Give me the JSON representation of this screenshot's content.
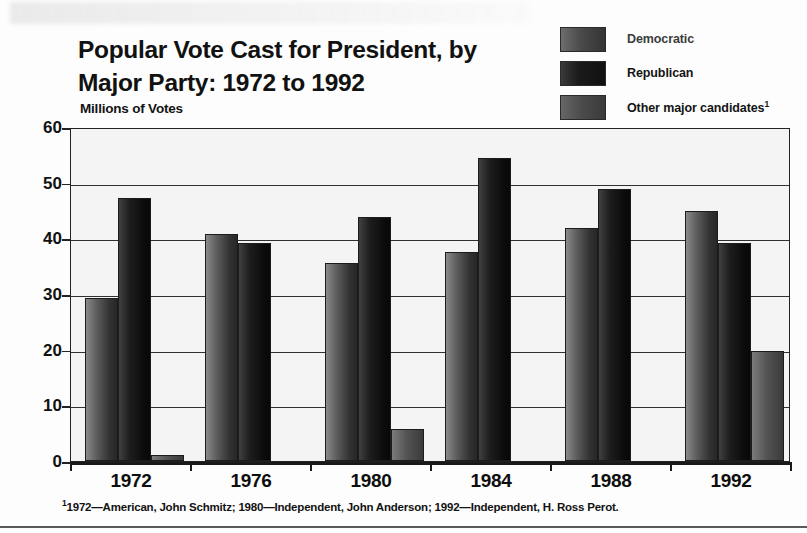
{
  "title": {
    "line1": "Popular Vote Cast for President, by",
    "line2": "Major Party: 1972 to 1992"
  },
  "axis_caption": "Millions of Votes",
  "legend": {
    "items": [
      {
        "label": "Democratic",
        "swatch": "dem-swatch"
      },
      {
        "label": "Republican",
        "swatch": "rep-swatch"
      },
      {
        "label": "Other major candidates",
        "superscript": "1",
        "swatch": "other-swatch"
      }
    ]
  },
  "footnote": {
    "marker": "1",
    "text": "1972—American, John Schmitz; 1980—Independent, John Anderson; 1992—Independent, H. Ross Perot."
  },
  "chart_data": {
    "type": "bar",
    "title": "Popular Vote Cast for President, by Major Party: 1972 to 1992",
    "xlabel": "",
    "ylabel": "Millions of Votes",
    "ylim": [
      0,
      60
    ],
    "yticks": [
      0,
      10,
      20,
      30,
      40,
      50,
      60
    ],
    "ytick_labels": [
      "0",
      "10",
      "20",
      "30",
      "40",
      "50",
      "60"
    ],
    "grid": true,
    "legend_position": "top-right",
    "categories": [
      "1972",
      "1976",
      "1980",
      "1984",
      "1988",
      "1992"
    ],
    "series": [
      {
        "name": "Democratic",
        "values": [
          29.2,
          40.8,
          35.5,
          37.6,
          41.8,
          44.9
        ],
        "color": "#4a4a4a"
      },
      {
        "name": "Republican",
        "values": [
          47.2,
          39.1,
          43.9,
          54.5,
          48.9,
          39.1
        ],
        "color": "#141414"
      },
      {
        "name": "Other major candidates",
        "values": [
          1.1,
          0,
          5.7,
          0,
          0,
          19.7
        ],
        "color": "#555555"
      }
    ]
  }
}
